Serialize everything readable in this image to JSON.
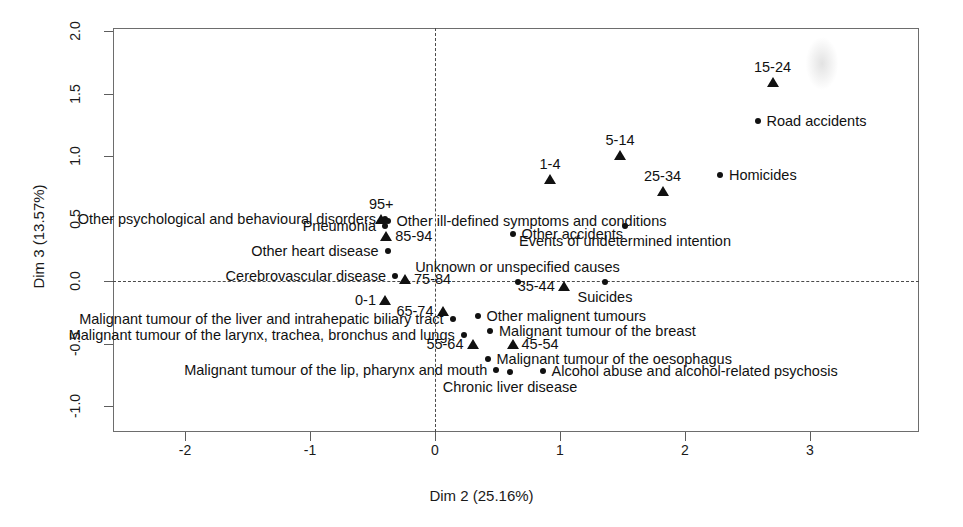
{
  "chart_data": {
    "type": "scatter",
    "title": "",
    "xlabel": "Dim 2 (25.16%)",
    "ylabel": "Dim 3 (13.57%)",
    "xlim": [
      -2.575,
      3.87
    ],
    "ylim": [
      -1.23,
      2.06
    ],
    "xticks": [
      -2,
      -1,
      0,
      1,
      2,
      3
    ],
    "xticklabels": [
      "-2",
      "-1",
      "0",
      "1",
      "2",
      "3"
    ],
    "yticks": [
      -1.0,
      -0.5,
      0.0,
      0.5,
      1.0,
      1.5,
      2.0
    ],
    "yticklabels": [
      "-1.0",
      "-0.5",
      "0.0",
      "0.5",
      "1.0",
      "1.5",
      "2.0"
    ],
    "grid": false,
    "legend": "none",
    "reference_lines": {
      "h": 0.0,
      "v": 0.0,
      "style": "dashed"
    },
    "series": [
      {
        "name": "Age groups",
        "marker": "triangle",
        "color": "#111111",
        "points": [
          {
            "label": "95+",
            "x": -0.43,
            "y": 0.5,
            "label_pos": "above"
          },
          {
            "label": "85-94",
            "x": -0.39,
            "y": 0.36,
            "label_pos": "right"
          },
          {
            "label": "75-84",
            "x": -0.24,
            "y": 0.02,
            "label_pos": "right"
          },
          {
            "label": "0-1",
            "x": -0.4,
            "y": -0.15,
            "label_pos": "left"
          },
          {
            "label": "65-74",
            "x": 0.06,
            "y": -0.24,
            "label_pos": "left"
          },
          {
            "label": "55-64",
            "x": 0.3,
            "y": -0.5,
            "label_pos": "left"
          },
          {
            "label": "45-54",
            "x": 0.62,
            "y": -0.5,
            "label_pos": "right"
          },
          {
            "label": "35-44",
            "x": 1.03,
            "y": -0.04,
            "label_pos": "left"
          },
          {
            "label": "25-34",
            "x": 1.82,
            "y": 0.72,
            "label_pos": "above"
          },
          {
            "label": "15-24",
            "x": 2.7,
            "y": 1.59,
            "label_pos": "above"
          },
          {
            "label": "5-14",
            "x": 1.48,
            "y": 1.01,
            "label_pos": "above"
          },
          {
            "label": "1-4",
            "x": 0.92,
            "y": 0.82,
            "label_pos": "above"
          }
        ]
      },
      {
        "name": "Causes of death",
        "marker": "dot",
        "color": "#111111",
        "points": [
          {
            "label": "Other psychological and behavioural disorders",
            "x": -0.4,
            "y": 0.5,
            "label_pos": "left"
          },
          {
            "label": "Other ill-defined symptoms and conditions",
            "x": -0.38,
            "y": 0.48,
            "label_pos": "right"
          },
          {
            "label": "Pneumonia",
            "x": -0.4,
            "y": 0.44,
            "label_pos": "left"
          },
          {
            "label": "Other heart disease",
            "x": -0.38,
            "y": 0.24,
            "label_pos": "left"
          },
          {
            "label": "Cerebrovascular disease",
            "x": -0.32,
            "y": 0.04,
            "label_pos": "left"
          },
          {
            "label": "Other accidents",
            "x": 0.62,
            "y": 0.38,
            "label_pos": "right"
          },
          {
            "label": "Events of undetermined intention",
            "x": 1.52,
            "y": 0.44,
            "label_pos": "below"
          },
          {
            "label": "Unknown or unspecified causes",
            "x": 0.66,
            "y": -0.01,
            "label_pos": "above"
          },
          {
            "label": "Suicides",
            "x": 1.36,
            "y": -0.01,
            "label_pos": "below"
          },
          {
            "label": "Homicides",
            "x": 2.28,
            "y": 0.85,
            "label_pos": "right"
          },
          {
            "label": "Road accidents",
            "x": 2.58,
            "y": 1.28,
            "label_pos": "right"
          },
          {
            "label": "Other malignent tumours",
            "x": 0.34,
            "y": -0.28,
            "label_pos": "right"
          },
          {
            "label": "Malignant tumour of the liver and intrahepatic biliary tract",
            "x": 0.14,
            "y": -0.3,
            "label_pos": "left"
          },
          {
            "label": "Malignant tumour of the breast",
            "x": 0.44,
            "y": -0.4,
            "label_pos": "right"
          },
          {
            "label": "Malignant tumour of the larynx, trachea, bronchus and lungs",
            "x": 0.23,
            "y": -0.43,
            "label_pos": "left"
          },
          {
            "label": "Malignant tumour of the oesophagus",
            "x": 0.42,
            "y": -0.62,
            "label_pos": "right"
          },
          {
            "label": "Malignant tumour of the lip, pharynx and mouth",
            "x": 0.49,
            "y": -0.71,
            "label_pos": "left"
          },
          {
            "label": "Chronic liver disease",
            "x": 0.6,
            "y": -0.73,
            "label_pos": "below"
          },
          {
            "label": "Alcohol abuse and alcohol-related psychosis",
            "x": 0.86,
            "y": -0.72,
            "label_pos": "right"
          }
        ]
      }
    ]
  }
}
